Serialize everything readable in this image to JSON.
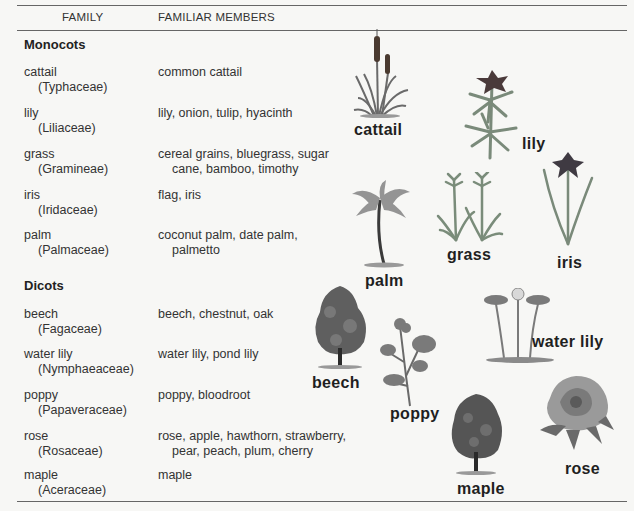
{
  "table": {
    "headers": {
      "family": "FAMILY",
      "members": "FAMILIAR MEMBERS"
    },
    "groups": [
      {
        "name": "Monocots",
        "rows": [
          {
            "family": "cattail",
            "scientific": "(Typhaceae)",
            "members": [
              "common cattail"
            ]
          },
          {
            "family": "lily",
            "scientific": "(Liliaceae)",
            "members": [
              "lily, onion, tulip, hyacinth"
            ]
          },
          {
            "family": "grass",
            "scientific": "(Gramineae)",
            "members": [
              "cereal grains, bluegrass, sugar",
              "cane, bamboo, timothy"
            ]
          },
          {
            "family": "iris",
            "scientific": "(Iridaceae)",
            "members": [
              "flag, iris"
            ]
          },
          {
            "family": "palm",
            "scientific": "(Palmaceae)",
            "members": [
              "coconut palm, date palm,",
              "palmetto"
            ]
          }
        ]
      },
      {
        "name": "Dicots",
        "rows": [
          {
            "family": "beech",
            "scientific": "(Fagaceae)",
            "members": [
              "beech, chestnut, oak"
            ]
          },
          {
            "family": "water lily",
            "scientific": "(Nymphaeaceae)",
            "members": [
              "water lily, pond lily"
            ]
          },
          {
            "family": "poppy",
            "scientific": "(Papaveraceae)",
            "members": [
              "poppy, bloodroot"
            ]
          },
          {
            "family": "rose",
            "scientific": "(Rosaceae)",
            "members": [
              "rose, apple, hawthorn, strawberry,",
              "pear, peach, plum, cherry"
            ]
          },
          {
            "family": "maple",
            "scientific": "(Aceraceae)",
            "members": [
              "maple"
            ]
          }
        ]
      }
    ]
  },
  "illustrations": {
    "cattail": "cattail",
    "lily": "lily",
    "grass": "grass",
    "iris": "iris",
    "palm": "palm",
    "beech": "beech",
    "water_lily": "water lily",
    "poppy": "poppy",
    "rose": "rose",
    "maple": "maple"
  }
}
